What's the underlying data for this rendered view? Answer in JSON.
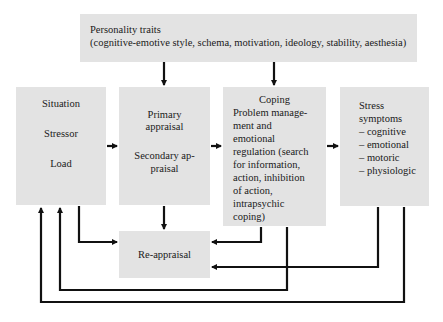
{
  "diagram": {
    "type": "flowchart",
    "nodes": {
      "traits": {
        "title": "Personality traits",
        "detail": "(cognitive-emotive style, schema, motivation, ideology, stability, aesthesia)"
      },
      "situation": {
        "lines": [
          "Situation",
          "Stressor",
          "Load"
        ]
      },
      "appraisal": {
        "lines": [
          "Primary",
          "appraisal",
          "Secondary ap-",
          "praisal"
        ]
      },
      "coping": {
        "title": "Coping",
        "lines": [
          "Problem manage-",
          "ment and",
          "emotional",
          "regulation (search",
          "for information,",
          "action, inhibition",
          "of action,",
          "intrapsychic",
          "coping)"
        ]
      },
      "stress": {
        "lines": [
          "Stress",
          "symptoms",
          "– cognitive",
          "– emotional",
          "– motoric",
          "– physiologic"
        ]
      },
      "reappraisal": {
        "label": "Re-appraisal"
      }
    },
    "edges": [
      {
        "from": "Personality traits",
        "to": "Primary appraisal"
      },
      {
        "from": "Personality traits",
        "to": "Coping"
      },
      {
        "from": "Situation",
        "to": "Primary appraisal"
      },
      {
        "from": "Primary appraisal",
        "to": "Coping"
      },
      {
        "from": "Coping",
        "to": "Stress symptoms"
      },
      {
        "from": "Primary appraisal",
        "to": "Re-appraisal"
      },
      {
        "from": "Situation",
        "to": "Re-appraisal"
      },
      {
        "from": "Coping",
        "to": "Re-appraisal"
      },
      {
        "from": "Stress symptoms",
        "to": "Re-appraisal"
      },
      {
        "from": "Coping",
        "to": "Situation"
      },
      {
        "from": "Stress symptoms",
        "to": "Situation"
      }
    ],
    "colors": {
      "box_fill": "#e3e3e3",
      "line": "#111111"
    }
  }
}
